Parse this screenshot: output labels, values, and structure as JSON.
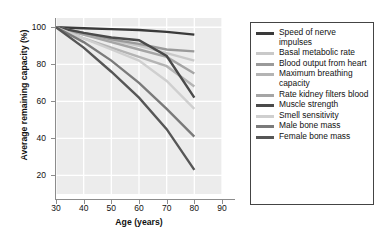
{
  "chart_data": {
    "type": "line",
    "title": "",
    "xlabel": "Age (years)",
    "ylabel": "Average remaining capacity (%)",
    "xlim": [
      30,
      90
    ],
    "ylim": [
      10,
      105
    ],
    "xticks": [
      30,
      40,
      50,
      60,
      70,
      80,
      90
    ],
    "yticks": [
      20,
      40,
      60,
      80,
      100
    ],
    "grid": true,
    "legend_position": "right",
    "x": [
      30,
      40,
      50,
      60,
      70,
      80
    ],
    "series": [
      {
        "name": "Speed of nerve impulses",
        "color": "#3a3a3a",
        "values": [
          100,
          99.5,
          99,
          98.5,
          97.5,
          96
        ]
      },
      {
        "name": "Basal metabolic rate",
        "color": "#c9c9c9",
        "values": [
          100,
          96,
          93,
          90,
          86,
          82
        ]
      },
      {
        "name": "Blood output from heart",
        "color": "#9a9a9a",
        "values": [
          100,
          97,
          93.5,
          91,
          88,
          87
        ]
      },
      {
        "name": "Maximum breathing capacity",
        "color": "#b4b4b4",
        "values": [
          100,
          94,
          89,
          84,
          79,
          68
        ]
      },
      {
        "name": "Rate kidney filters blood",
        "color": "#a5a5a5",
        "values": [
          100,
          96,
          92,
          88,
          84,
          75
        ]
      },
      {
        "name": "Muscle strength",
        "color": "#4a4a4a",
        "values": [
          100,
          97,
          94.5,
          93,
          84.5,
          62
        ]
      },
      {
        "name": "Smell sensitivity",
        "color": "#cfcfcf",
        "values": [
          100,
          94,
          88,
          82,
          71,
          56
        ]
      },
      {
        "name": "Male bone mass",
        "color": "#7a7a7a",
        "values": [
          100,
          92,
          82,
          70,
          56,
          41
        ]
      },
      {
        "name": "Female bone mass",
        "color": "#565656",
        "values": [
          100,
          89,
          76,
          62,
          45,
          23
        ]
      }
    ]
  },
  "legend": {
    "items": [
      {
        "label": "Speed of nerve impulses"
      },
      {
        "label": "Basal metabolic rate"
      },
      {
        "label": "Blood output from heart"
      },
      {
        "label": "Maximum breathing capacity"
      },
      {
        "label": "Rate kidney filters blood"
      },
      {
        "label": "Muscle strength"
      },
      {
        "label": "Smell sensitivity"
      },
      {
        "label": "Male bone mass"
      },
      {
        "label": "Female bone mass"
      }
    ]
  }
}
